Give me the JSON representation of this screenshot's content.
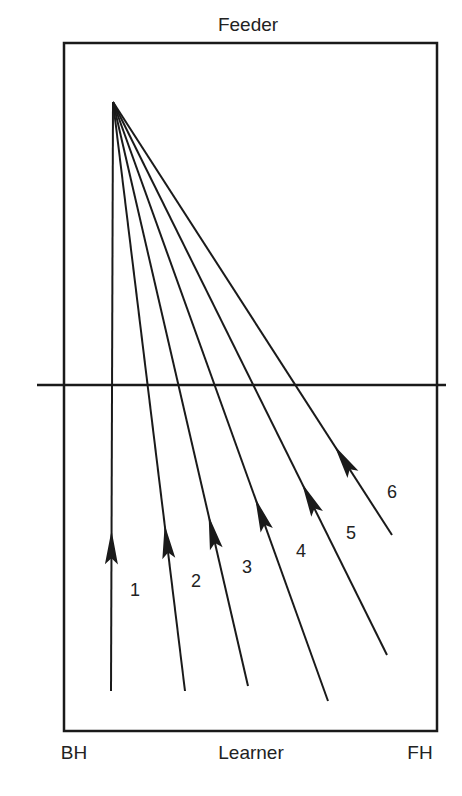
{
  "diagram": {
    "colors": {
      "ink": "#1a1a1a",
      "text": "#222222",
      "background": "#ffffff"
    },
    "labels": {
      "top": {
        "text": "Feeder",
        "x": 248,
        "y": 31
      },
      "bottom_center": {
        "text": "Learner",
        "x": 251,
        "y": 759
      },
      "bottom_left": {
        "text": "BH",
        "x": 74,
        "y": 759
      },
      "bottom_right": {
        "text": "FH",
        "x": 420,
        "y": 759
      }
    },
    "court": {
      "x1": 64,
      "y1": 43,
      "x2": 437,
      "y2": 731
    },
    "net": {
      "x1": 37,
      "x2": 446,
      "y": 385
    },
    "apex": {
      "x": 113,
      "y": 102
    },
    "rays": [
      {
        "id": "1",
        "label": "1",
        "end_x": 111,
        "end_y": 691,
        "arrow_t": 0.785,
        "label_x": 130,
        "label_y": 596
      },
      {
        "id": "2",
        "label": "2",
        "end_x": 185,
        "end_y": 691,
        "arrow_t": 0.775,
        "label_x": 191,
        "label_y": 587
      },
      {
        "id": "3",
        "label": "3",
        "end_x": 248,
        "end_y": 686,
        "arrow_t": 0.765,
        "label_x": 242,
        "label_y": 573
      },
      {
        "id": "4",
        "label": "4",
        "end_x": 328,
        "end_y": 701,
        "arrow_t": 0.715,
        "label_x": 296,
        "label_y": 557
      },
      {
        "id": "5",
        "label": "5",
        "end_x": 387,
        "end_y": 655,
        "arrow_t": 0.745,
        "label_x": 346,
        "label_y": 539
      },
      {
        "id": "6",
        "label": "6",
        "end_x": 392,
        "end_y": 535,
        "arrow_t": 0.86,
        "label_x": 387,
        "label_y": 498
      }
    ]
  }
}
